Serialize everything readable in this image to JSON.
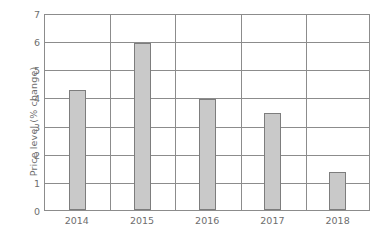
{
  "chart": {
    "type": "bar",
    "ylabel": "Price level (% change)",
    "xlabel": "",
    "title": ""
  },
  "chart_data": {
    "type": "bar",
    "title": "",
    "xlabel": "",
    "ylabel": "Price level (% change)",
    "categories": [
      "2014",
      "2015",
      "2016",
      "2017",
      "2018"
    ],
    "values": [
      4.3,
      6.0,
      4.0,
      3.5,
      1.35
    ],
    "ylim": [
      0,
      7
    ],
    "ytick_labels": [
      "0",
      "1",
      "2",
      "3",
      "4",
      "5",
      "6",
      "7"
    ],
    "ytick_values": [
      0,
      1,
      2,
      3,
      4,
      5,
      6,
      7
    ],
    "grid": true,
    "legend": false,
    "bar_color": "#c9c9c9",
    "bar_border_color": "#7d7d7d",
    "axis_color": "#8c8c8c",
    "text_color": "#6e6e6e",
    "background": "#ffffff"
  }
}
